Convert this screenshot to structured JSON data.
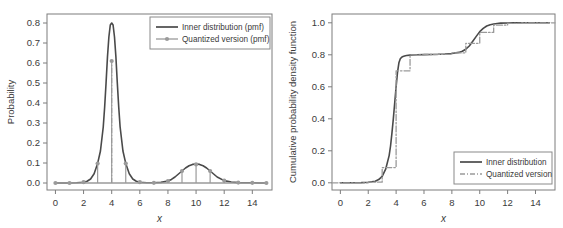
{
  "figure": {
    "background": "#ffffff",
    "inner_color": "#4a4a4a",
    "quantized_color": "#9a9a9a"
  },
  "chart_data": [
    {
      "id": "left",
      "type": "line",
      "title": "",
      "xlabel": "x",
      "ylabel": "Probability",
      "xlim": [
        -0.6,
        15.4
      ],
      "ylim": [
        -0.035,
        0.845
      ],
      "xticks": [
        0,
        2,
        4,
        6,
        8,
        10,
        12,
        14
      ],
      "xtick_labels": [
        "0",
        "2",
        "4",
        "6",
        "8",
        "10",
        "12",
        "14"
      ],
      "yticks": [
        0.0,
        0.1,
        0.2,
        0.3,
        0.4,
        0.5,
        0.6,
        0.7,
        0.8
      ],
      "ytick_labels": [
        "0.0",
        "0.1",
        "0.2",
        "0.3",
        "0.4",
        "0.5",
        "0.6",
        "0.7",
        "0.8"
      ],
      "grid": false,
      "legend_position": "top-right",
      "legend": [
        "Inner distribution (pmf)",
        "Quantized version (pmf)"
      ],
      "series": [
        {
          "name": "Inner distribution (pmf)",
          "style": "solid",
          "color": "#4a4a4a",
          "x": [
            0.0,
            0.5,
            1.0,
            1.5,
            2.0,
            2.25,
            2.5,
            2.75,
            3.0,
            3.2,
            3.4,
            3.5,
            3.6,
            3.7,
            3.8,
            3.9,
            4.0,
            4.1,
            4.2,
            4.3,
            4.4,
            4.5,
            4.6,
            4.8,
            5.0,
            5.25,
            5.5,
            5.75,
            6.0,
            6.5,
            7.0,
            7.5,
            8.0,
            8.25,
            8.5,
            8.75,
            9.0,
            9.25,
            9.5,
            9.75,
            10.0,
            10.25,
            10.5,
            10.75,
            11.0,
            11.25,
            11.5,
            12.0,
            12.5,
            13.0,
            13.5,
            14.0,
            14.5,
            15.0
          ],
          "y": [
            0.0,
            0.0,
            0.0,
            0.001,
            0.004,
            0.009,
            0.02,
            0.046,
            0.098,
            0.16,
            0.28,
            0.38,
            0.5,
            0.63,
            0.73,
            0.79,
            0.8,
            0.79,
            0.73,
            0.63,
            0.5,
            0.38,
            0.28,
            0.16,
            0.098,
            0.046,
            0.02,
            0.009,
            0.004,
            0.001,
            0.001,
            0.003,
            0.01,
            0.018,
            0.03,
            0.045,
            0.06,
            0.075,
            0.086,
            0.093,
            0.095,
            0.093,
            0.086,
            0.075,
            0.06,
            0.045,
            0.03,
            0.012,
            0.005,
            0.002,
            0.001,
            0.001,
            0.0,
            0.0
          ]
        },
        {
          "name": "Quantized version (pmf)",
          "style": "stem",
          "color": "#9a9a9a",
          "x": [
            0,
            1,
            2,
            3,
            4,
            5,
            6,
            7,
            8,
            9,
            10,
            11,
            12,
            13,
            14,
            15
          ],
          "y": [
            0.0,
            0.0,
            0.004,
            0.097,
            0.61,
            0.097,
            0.004,
            0.001,
            0.01,
            0.06,
            0.093,
            0.06,
            0.012,
            0.002,
            0.001,
            0.0
          ]
        }
      ]
    },
    {
      "id": "right",
      "type": "line",
      "title": "",
      "xlabel": "x",
      "ylabel": "Cumulative probability density function",
      "xlim": [
        -0.6,
        15.4
      ],
      "ylim": [
        -0.045,
        1.055
      ],
      "xticks": [
        0,
        2,
        4,
        6,
        8,
        10,
        12,
        14
      ],
      "xtick_labels": [
        "0",
        "2",
        "4",
        "6",
        "8",
        "10",
        "12",
        "14"
      ],
      "yticks": [
        0.0,
        0.2,
        0.4,
        0.6,
        0.8,
        1.0
      ],
      "ytick_labels": [
        "0.0",
        "0.2",
        "0.4",
        "0.6",
        "0.8",
        "1.0"
      ],
      "grid": false,
      "legend_position": "bottom-right",
      "legend": [
        "Inner distribution",
        "Quantized version"
      ],
      "series": [
        {
          "name": "Inner distribution",
          "style": "solid",
          "color": "#4a4a4a",
          "x": [
            0.0,
            0.5,
            1.0,
            1.5,
            2.0,
            2.5,
            2.75,
            3.0,
            3.25,
            3.5,
            3.6,
            3.7,
            3.8,
            3.9,
            4.0,
            4.1,
            4.2,
            4.3,
            4.4,
            4.5,
            4.6,
            4.75,
            5.0,
            5.5,
            6.0,
            6.5,
            7.0,
            7.5,
            8.0,
            8.5,
            8.75,
            9.0,
            9.25,
            9.5,
            9.75,
            10.0,
            10.25,
            10.5,
            10.75,
            11.0,
            11.25,
            11.5,
            12.0,
            12.5,
            13.0,
            14.0,
            15.0
          ],
          "y": [
            0.0,
            0.0,
            0.0,
            0.001,
            0.003,
            0.01,
            0.02,
            0.04,
            0.085,
            0.17,
            0.23,
            0.31,
            0.4,
            0.5,
            0.6,
            0.69,
            0.75,
            0.775,
            0.785,
            0.79,
            0.793,
            0.796,
            0.798,
            0.8,
            0.801,
            0.802,
            0.803,
            0.805,
            0.808,
            0.815,
            0.822,
            0.835,
            0.855,
            0.885,
            0.915,
            0.945,
            0.965,
            0.98,
            0.988,
            0.993,
            0.996,
            0.998,
            0.999,
            1.0,
            1.0,
            1.0,
            1.0
          ]
        },
        {
          "name": "Quantized version",
          "style": "step",
          "color": "#9a9a9a",
          "x": [
            0,
            1,
            2,
            3,
            4,
            5,
            6,
            7,
            8,
            9,
            10,
            11,
            12,
            13,
            14,
            15
          ],
          "y": [
            0.0,
            0.0,
            0.004,
            0.095,
            0.7,
            0.8,
            0.802,
            0.803,
            0.812,
            0.872,
            0.94,
            0.985,
            0.996,
            0.999,
            1.0,
            1.0
          ]
        }
      ]
    }
  ]
}
